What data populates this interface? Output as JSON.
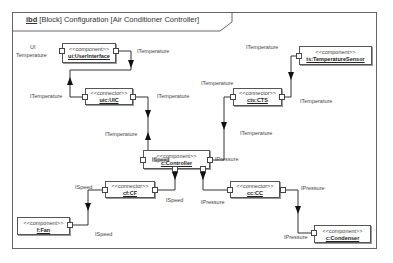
{
  "diagram": {
    "title_keyword": "ibd",
    "title_rest": " [Block] Configuration [Air Conditioner Controller]",
    "blocks": {
      "user_interface": {
        "stereotype": "<<component>>",
        "name": "ui:UserInterface"
      },
      "temperature_sensor": {
        "stereotype": "<<component>>",
        "name": "ts:TemperatureSensor"
      },
      "uic": {
        "stereotype": "<<connector>>",
        "name": "uic:UIC"
      },
      "cts": {
        "stereotype": "<<connector>>",
        "name": "cts:CTS"
      },
      "controller": {
        "stereotype": "<<component>>",
        "name": "c:Controller"
      },
      "cf": {
        "stereotype": "<<connector>>",
        "name": "cf:CF"
      },
      "cc": {
        "stereotype": "<<connector>>",
        "name": "cc:CC"
      },
      "fan": {
        "stereotype": "<<component>>",
        "name": "f:Fan"
      },
      "condenser": {
        "stereotype": "<<component>>",
        "name": "c:Condenser"
      }
    },
    "labels": {
      "ui_temperature_line1": "UI",
      "ui_temperature_line2": "Temperature",
      "ui_out": "ITemperature",
      "ts_out": "ITemperature",
      "uic_in": "ITemperature",
      "uic_out": "ITemperature",
      "cts_in": "ITemperature",
      "cts_out": "ITemperature",
      "ctrl_in_left": "ITemperature",
      "ctrl_in_right": "ITemperature",
      "ctrl_speed": "ISpeed",
      "ctrl_pressure": "IPressure",
      "cf_in": "ISpeed",
      "cf_out": "ISpeed",
      "cc_in": "IPressure",
      "cc_out": "IPressure",
      "fan_in": "ISpeed",
      "condenser_in": "IPressure"
    }
  }
}
